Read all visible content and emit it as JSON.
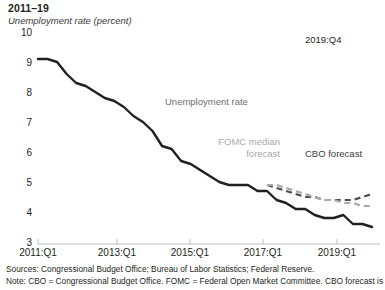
{
  "figure": {
    "title": "2011–19",
    "subtitle": "Unemployment rate (percent)",
    "endpoint_label": "2019:Q4",
    "series_label_actual": "Unemployment rate",
    "series_label_fomc_line1": "FOMC median",
    "series_label_fomc_line2": "forecast",
    "series_label_cbo": "CBO forecast",
    "sources_line": "Sources: Congressional Budget Office; Bureau of Labor Statistics; Federal Reserve.",
    "note_line": "Note: CBO = Congressional Budget Office. FOMC = Federal Open Market Committee. CBO forecast is",
    "colors": {
      "actual": "#231f20",
      "cbo_forecast": "#4d4d4f",
      "fomc_forecast": "#a7a9ac",
      "axis": "#bcbec0",
      "text": "#231f20",
      "muted_text": "#58595b",
      "background": "#ffffff"
    }
  },
  "chart_data": {
    "type": "line",
    "title": "2011–19",
    "xlabel": "",
    "ylabel": "Unemployment rate (percent)",
    "ylim": [
      3,
      10
    ],
    "yticks": [
      3,
      4,
      5,
      6,
      7,
      8,
      9,
      10
    ],
    "xticks": [
      "2011:Q1",
      "2013:Q1",
      "2015:Q1",
      "2017:Q1",
      "2019:Q1"
    ],
    "xlim": [
      "2011:Q1",
      "2019:Q4"
    ],
    "grid": false,
    "legend": "inline-annotations",
    "annotations": [
      {
        "text": "2019:Q4",
        "x": "2019:Q4",
        "y": 9.3
      },
      {
        "text": "Unemployment rate",
        "x": "2014:Q3",
        "y": 7.2
      },
      {
        "text": "FOMC median forecast",
        "x": "2016:Q4",
        "y": 5.6
      },
      {
        "text": "CBO forecast",
        "x": "2018:Q2",
        "y": 5.5
      }
    ],
    "series": [
      {
        "name": "Unemployment rate",
        "style": "solid",
        "color": "#231f20",
        "x": [
          "2011:Q1",
          "2011:Q2",
          "2011:Q3",
          "2011:Q4",
          "2012:Q1",
          "2012:Q2",
          "2012:Q3",
          "2012:Q4",
          "2013:Q1",
          "2013:Q2",
          "2013:Q3",
          "2013:Q4",
          "2014:Q1",
          "2014:Q2",
          "2014:Q3",
          "2014:Q4",
          "2015:Q1",
          "2015:Q2",
          "2015:Q3",
          "2015:Q4",
          "2016:Q1",
          "2016:Q2",
          "2016:Q3",
          "2016:Q4",
          "2017:Q1",
          "2017:Q2",
          "2017:Q3",
          "2017:Q4",
          "2018:Q1",
          "2018:Q2",
          "2018:Q3",
          "2018:Q4",
          "2019:Q1",
          "2019:Q2",
          "2019:Q3",
          "2019:Q4"
        ],
        "values": [
          9.1,
          9.1,
          9.0,
          8.6,
          8.3,
          8.2,
          8.0,
          7.8,
          7.7,
          7.5,
          7.2,
          7.0,
          6.7,
          6.2,
          6.1,
          5.7,
          5.6,
          5.4,
          5.2,
          5.0,
          4.9,
          4.9,
          4.9,
          4.7,
          4.7,
          4.4,
          4.3,
          4.1,
          4.1,
          3.9,
          3.8,
          3.8,
          3.9,
          3.6,
          3.6,
          3.5
        ]
      },
      {
        "name": "CBO forecast",
        "style": "dashed",
        "color": "#4d4d4f",
        "x": [
          "2017:Q1",
          "2017:Q2",
          "2017:Q3",
          "2017:Q4",
          "2018:Q1",
          "2018:Q2",
          "2018:Q3",
          "2018:Q4",
          "2019:Q1",
          "2019:Q2",
          "2019:Q3",
          "2019:Q4"
        ],
        "values": [
          4.9,
          4.8,
          4.7,
          4.6,
          4.5,
          4.5,
          4.4,
          4.4,
          4.4,
          4.4,
          4.5,
          4.6
        ]
      },
      {
        "name": "FOMC median forecast",
        "style": "dashed",
        "color": "#a7a9ac",
        "x": [
          "2017:Q1",
          "2017:Q2",
          "2017:Q3",
          "2017:Q4",
          "2018:Q1",
          "2018:Q2",
          "2018:Q3",
          "2018:Q4",
          "2019:Q1",
          "2019:Q2",
          "2019:Q3",
          "2019:Q4"
        ],
        "values": [
          4.9,
          4.9,
          4.8,
          4.7,
          4.6,
          4.5,
          4.4,
          4.4,
          4.3,
          4.3,
          4.2,
          4.2
        ]
      }
    ]
  }
}
